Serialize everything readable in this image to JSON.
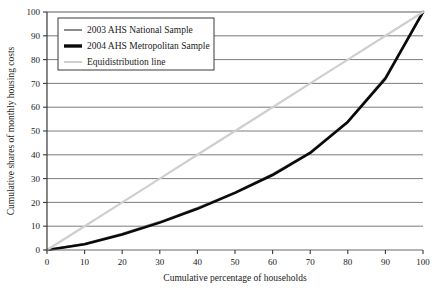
{
  "chart_data": {
    "type": "line",
    "title": "",
    "xlabel": "Cumulative percentage of households",
    "ylabel": "Cumulative shares of monthly housing costs",
    "xlim": [
      0,
      100
    ],
    "ylim": [
      0,
      100
    ],
    "xticks": [
      0,
      10,
      20,
      30,
      40,
      50,
      60,
      70,
      80,
      90,
      100
    ],
    "yticks": [
      0,
      10,
      20,
      30,
      40,
      50,
      60,
      70,
      80,
      90,
      100
    ],
    "grid": "horizontal",
    "legend_position": "top-left",
    "x": [
      0,
      10,
      20,
      30,
      40,
      50,
      60,
      70,
      80,
      90,
      100
    ],
    "series": [
      {
        "name": "2003 AHS National Sample",
        "color": "#8c8c8c",
        "width": 2.2,
        "values": [
          0,
          2.6,
          6.8,
          11.8,
          17.6,
          24.2,
          31.8,
          41.0,
          54.0,
          72.5,
          100
        ]
      },
      {
        "name": "2004 AHS Metropolitan Sample",
        "color": "#0a0a0a",
        "width": 2.6,
        "values": [
          0,
          2.4,
          6.5,
          11.5,
          17.3,
          24.0,
          31.5,
          40.8,
          53.8,
          72.0,
          100
        ]
      },
      {
        "name": "Equidistribution line",
        "color": "#cfcfcf",
        "width": 2.2,
        "values": [
          0,
          10,
          20,
          30,
          40,
          50,
          60,
          70,
          80,
          90,
          100
        ]
      }
    ]
  },
  "legend": {
    "items": [
      {
        "label": "2003 AHS National Sample",
        "swatch": "#8c8c8c",
        "thickness": 2
      },
      {
        "label": "2004 AHS Metropolitan Sample",
        "swatch": "#0a0a0a",
        "thickness": 3.4
      },
      {
        "label": "Equidistribution line",
        "swatch": "#cfcfcf",
        "thickness": 2
      }
    ]
  },
  "axes": {
    "x_label": "Cumulative percentage of households",
    "y_label": "Cumulative shares of monthly housing costs",
    "x_ticks": [
      "0",
      "10",
      "20",
      "30",
      "40",
      "50",
      "60",
      "70",
      "80",
      "90",
      "100"
    ],
    "y_ticks": [
      "0",
      "10",
      "20",
      "30",
      "40",
      "50",
      "60",
      "70",
      "80",
      "90",
      "100"
    ]
  },
  "colors": {
    "axis": "#3a3a3a",
    "grid": "#5a5a5a",
    "background": "#ffffff",
    "text": "#1a1a1a"
  }
}
